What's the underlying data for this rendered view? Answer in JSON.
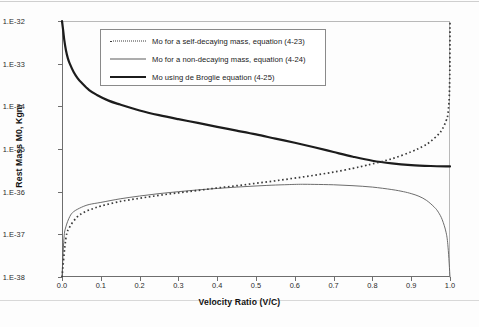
{
  "chart_data": {
    "type": "line",
    "title": "",
    "xlabel": "Velocity Ratio (V/C)",
    "ylabel": "Rest Mass M0, Kgm",
    "yscale": "log",
    "ylim": [
      1e-38,
      1e-32
    ],
    "xlim": [
      0.0,
      1.0
    ],
    "grid": false,
    "legend_position": "upper-center-inside",
    "x_ticks": [
      "0.0",
      "0.1",
      "0.2",
      "0.3",
      "0.4",
      "0.5",
      "0.6",
      "0.7",
      "0.8",
      "0.9",
      "1.0"
    ],
    "x_tick_values": [
      0.0,
      0.1,
      0.2,
      0.3,
      0.4,
      0.5,
      0.6,
      0.7,
      0.8,
      0.9,
      1.0
    ],
    "y_ticks": [
      "1.E-38",
      "1.E-37",
      "1.E-36",
      "1.E-35",
      "1.E-34",
      "1.E-33",
      "1.E-32"
    ],
    "y_tick_values": [
      1e-38,
      1e-37,
      1e-36,
      1e-35,
      1e-34,
      1e-33,
      1e-32
    ],
    "series": [
      {
        "name": "Mo for a self-decaying mass, equation (4-23)",
        "style": "dotted",
        "color": "#3a3a3a",
        "x": [
          0.0,
          0.01,
          0.02,
          0.04,
          0.06,
          0.08,
          0.1,
          0.15,
          0.2,
          0.25,
          0.3,
          0.35,
          0.4,
          0.45,
          0.5,
          0.55,
          0.6,
          0.65,
          0.7,
          0.75,
          0.78,
          0.8,
          0.85,
          0.9,
          0.93,
          0.95,
          0.97,
          0.98,
          0.99,
          0.995,
          0.999,
          1.0
        ],
        "y": [
          1e-38,
          8e-38,
          1.5e-37,
          2.6e-37,
          3.4e-37,
          4e-37,
          4.6e-37,
          5.9e-37,
          7e-37,
          8.2e-37,
          9.4e-37,
          1.07e-36,
          1.22e-36,
          1.38e-36,
          1.57e-36,
          1.8e-36,
          2.08e-36,
          2.42e-36,
          2.88e-36,
          3.52e-36,
          4.05e-36,
          4.48e-36,
          5.9e-36,
          8.6e-36,
          1.15e-35,
          1.5e-35,
          2.2e-35,
          2.9e-35,
          4.6e-35,
          7e-35,
          3e-34,
          1e-32
        ]
      },
      {
        "name": "Mo for a non-decaying mass, equation (4-24)",
        "style": "thin-solid",
        "color": "#5c5c5c",
        "x": [
          0.0,
          0.005,
          0.01,
          0.02,
          0.03,
          0.05,
          0.07,
          0.1,
          0.15,
          0.2,
          0.25,
          0.3,
          0.35,
          0.4,
          0.45,
          0.5,
          0.55,
          0.58,
          0.6,
          0.62,
          0.65,
          0.7,
          0.75,
          0.8,
          0.85,
          0.88,
          0.9,
          0.92,
          0.94,
          0.96,
          0.97,
          0.98,
          0.99,
          0.995,
          1.0
        ],
        "y": [
          1e-38,
          8e-38,
          1.5e-37,
          2.6e-37,
          3.4e-37,
          4.3e-37,
          5e-37,
          5.6e-37,
          6.8e-37,
          7.9e-37,
          9e-37,
          1e-36,
          1.1e-36,
          1.19e-36,
          1.28e-36,
          1.36e-36,
          1.43e-36,
          1.46e-36,
          1.48e-36,
          1.49e-36,
          1.48e-36,
          1.45e-36,
          1.38e-36,
          1.28e-36,
          1.12e-36,
          1e-36,
          9e-37,
          7.8e-37,
          6.2e-37,
          4.3e-37,
          3.3e-37,
          2.2e-37,
          1.1e-37,
          5e-38,
          1e-38
        ]
      },
      {
        "name": "Mo using de Broglie equation (4-25)",
        "style": "thick-solid",
        "color": "#1c1c1c",
        "x": [
          0.0,
          0.003,
          0.006,
          0.01,
          0.015,
          0.02,
          0.03,
          0.04,
          0.05,
          0.07,
          0.09,
          0.12,
          0.15,
          0.2,
          0.25,
          0.3,
          0.35,
          0.4,
          0.45,
          0.5,
          0.55,
          0.6,
          0.65,
          0.7,
          0.75,
          0.8,
          0.85,
          0.9,
          0.95,
          1.0
        ],
        "y": [
          1e-32,
          6e-33,
          3.5e-33,
          2.1e-33,
          1.35e-33,
          1e-33,
          6.4e-34,
          4.6e-34,
          3.6e-34,
          2.4e-34,
          1.85e-34,
          1.36e-34,
          1.1e-34,
          8e-35,
          6.2e-35,
          5e-35,
          4.1e-35,
          3.3e-35,
          2.7e-35,
          2.2e-35,
          1.75e-35,
          1.4e-35,
          1.1e-35,
          8.5e-36,
          6.6e-36,
          5.3e-36,
          4.6e-36,
          4.2e-36,
          4e-36,
          3.9e-36
        ]
      }
    ]
  },
  "legend": {
    "entries": [
      {
        "label": "Mo for a self-decaying mass, equation (4-23)",
        "style": "dotted"
      },
      {
        "label": "Mo for a non-decaying mass, equation (4-24)",
        "style": "thin-solid"
      },
      {
        "label": "Mo using de Broglie equation (4-25)",
        "style": "thick-solid"
      }
    ]
  },
  "axes": {
    "x_title": "Velocity Ratio (V/C)",
    "y_title": "Rest Mass M0, Kgm"
  }
}
